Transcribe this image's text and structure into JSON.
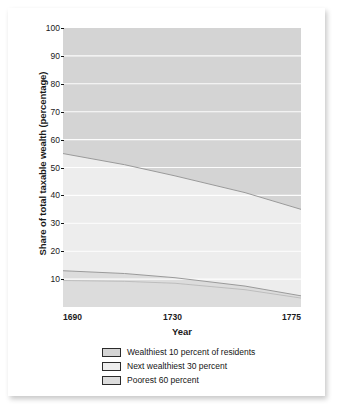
{
  "chart_data": {
    "type": "area",
    "title": "",
    "subtitle": "",
    "xlabel": "Year",
    "ylabel": "Share of total taxable wealth (percentage)",
    "xlim": [
      1690,
      1775
    ],
    "ylim": [
      0,
      100
    ],
    "grid": true,
    "stacked": true,
    "legend_position": "bottom",
    "x": [
      1690,
      1730,
      1775
    ],
    "xticks": [
      "1690",
      "1730",
      "1775"
    ],
    "yticks": [
      "10",
      "20",
      "30",
      "40",
      "50",
      "60",
      "70",
      "80",
      "90",
      "100"
    ],
    "series": [
      {
        "name": "Wealthiest 10 percent of residents",
        "color": "#d4d4d4",
        "values": [
          45,
          53,
          65
        ],
        "cumulative_top": [
          100,
          100,
          100
        ],
        "cumulative_bottom": [
          55,
          47,
          35
        ]
      },
      {
        "name": "Next wealthiest 30 percent",
        "color": "#ededed",
        "values": [
          42,
          40,
          31
        ],
        "cumulative_top": [
          55,
          47,
          35
        ],
        "cumulative_bottom": [
          13,
          7,
          4
        ]
      },
      {
        "name": "Poorest 60 percent",
        "color": "#dcdcdc",
        "values": [
          13,
          7,
          4
        ],
        "cumulative_top": [
          13,
          7,
          4
        ],
        "cumulative_bottom": [
          0,
          0,
          0
        ]
      }
    ],
    "boundary_upper": [
      {
        "year": 1690,
        "value": 55
      },
      {
        "year": 1712,
        "value": 51
      },
      {
        "year": 1730,
        "value": 47
      },
      {
        "year": 1755,
        "value": 41
      },
      {
        "year": 1775,
        "value": 35
      }
    ],
    "boundary_lower": [
      {
        "year": 1690,
        "value": 13
      },
      {
        "year": 1712,
        "value": 12
      },
      {
        "year": 1730,
        "value": 10.5
      },
      {
        "year": 1755,
        "value": 7.5
      },
      {
        "year": 1775,
        "value": 4
      }
    ],
    "boundary_lower_secondary": [
      {
        "year": 1690,
        "value": 9.5
      },
      {
        "year": 1712,
        "value": 9.2
      },
      {
        "year": 1730,
        "value": 8.5
      },
      {
        "year": 1755,
        "value": 6.2
      },
      {
        "year": 1775,
        "value": 3.2
      }
    ]
  },
  "axes": {
    "y_title": "Share of total taxable wealth (percentage)",
    "x_title": "Year",
    "y_ticks": [
      "100",
      "90",
      "80",
      "70",
      "60",
      "50",
      "40",
      "30",
      "20",
      "10"
    ],
    "x_ticks": [
      "1690",
      "1730",
      "1775"
    ]
  },
  "legend": {
    "items": [
      {
        "label": "Wealthiest 10 percent of residents",
        "color": "#d4d4d4"
      },
      {
        "label": "Next wealthiest 30 percent",
        "color": "#ededed"
      },
      {
        "label": "Poorest 60 percent",
        "color": "#dcdcdc"
      }
    ]
  },
  "colors": {
    "band_top": "#d4d4d4",
    "band_middle": "#ededed",
    "band_bottom": "#dcdcdc",
    "gridline": "#ffffff",
    "text": "#1a1a1a",
    "card": "#ffffff"
  }
}
